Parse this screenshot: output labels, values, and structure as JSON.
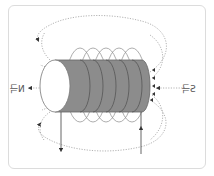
{
  "diagram": {
    "labels": {
      "north": "N극",
      "south": "S극"
    },
    "colors": {
      "frame_border": "#dcdcdc",
      "core_fill": "#8c8c8c",
      "core_face": "#ffffff",
      "coil": "#777777",
      "field_line": "#aaaaaa",
      "arrow": "#333333"
    }
  }
}
